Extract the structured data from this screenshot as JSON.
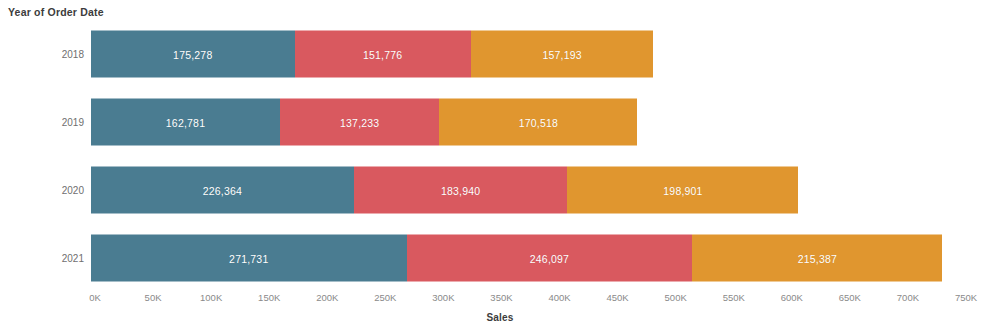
{
  "header": {
    "row_field_title": "Year of Order Date"
  },
  "axis": {
    "x_title": "Sales",
    "x_ticks": [
      "0K",
      "50K",
      "100K",
      "150K",
      "200K",
      "250K",
      "300K",
      "350K",
      "400K",
      "450K",
      "500K",
      "550K",
      "600K",
      "650K",
      "700K",
      "750K"
    ]
  },
  "colors": {
    "series_1": "#4a7c91",
    "series_2": "#d9595f",
    "series_3": "#e0962f",
    "background": "#ffffff",
    "label_text": "#ffffff",
    "tick_text": "#8a8a8a",
    "title_text": "#3c3c3c"
  },
  "chart_data": {
    "type": "bar",
    "orientation": "horizontal",
    "stacked": true,
    "title": "Year of Order Date",
    "xlabel": "Sales",
    "ylabel": "Year of Order Date",
    "xlim": [
      0,
      750000
    ],
    "grid": false,
    "legend": "none",
    "categories": [
      "2018",
      "2019",
      "2020",
      "2021"
    ],
    "series": [
      {
        "name": "series_1",
        "color": "#4a7c91",
        "values": [
          175278,
          162781,
          226364,
          271731
        ],
        "labels": [
          "175,278",
          "162,781",
          "226,364",
          "271,731"
        ]
      },
      {
        "name": "series_2",
        "color": "#d9595f",
        "values": [
          151776,
          137233,
          183940,
          246097
        ],
        "labels": [
          "151,776",
          "137,233",
          "183,940",
          "246,097"
        ]
      },
      {
        "name": "series_3",
        "color": "#e0962f",
        "values": [
          157193,
          170518,
          198901,
          215387
        ],
        "labels": [
          "157,193",
          "170,518",
          "198,901",
          "215,387"
        ]
      }
    ],
    "totals": [
      484247,
      470532,
      609205,
      733215
    ]
  }
}
